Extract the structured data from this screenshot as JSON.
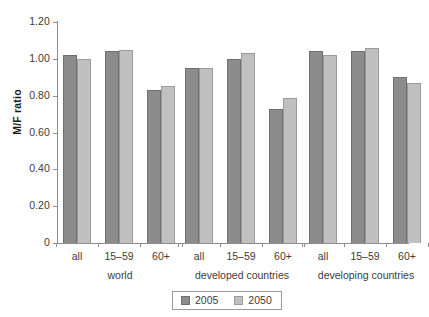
{
  "chart_data": {
    "type": "bar",
    "title": "",
    "xlabel": "",
    "ylabel": "M/F ratio",
    "ylim": [
      0,
      1.2
    ],
    "grid": false,
    "legend_position": "bottom-center",
    "y_ticks": [
      "0",
      "0.20",
      "0.40",
      "0.60",
      "0.80",
      "1.00",
      "1.20"
    ],
    "y_tick_values": [
      0,
      0.2,
      0.4,
      0.6,
      0.8,
      1.0,
      1.2
    ],
    "groups": [
      {
        "name": "world",
        "categories": [
          "all",
          "15–59",
          "60+"
        ],
        "values_2005": [
          1.02,
          1.04,
          0.83
        ],
        "values_2050": [
          1.0,
          1.05,
          0.85
        ]
      },
      {
        "name": "developed countries",
        "categories": [
          "all",
          "15–59",
          "60+"
        ],
        "values_2005": [
          0.95,
          1.0,
          0.73
        ],
        "values_2050": [
          0.95,
          1.03,
          0.79
        ]
      },
      {
        "name": "developing countries",
        "categories": [
          "all",
          "15–59",
          "60+"
        ],
        "values_2005": [
          1.04,
          1.04,
          0.9
        ],
        "values_2050": [
          1.02,
          1.06,
          0.87
        ]
      }
    ],
    "series": [
      {
        "name": "2005",
        "color": "#8c8c8c",
        "values": [
          1.02,
          1.04,
          0.83,
          0.95,
          1.0,
          0.73,
          1.04,
          1.04,
          0.9
        ]
      },
      {
        "name": "2050",
        "color": "#c0c0c0",
        "values": [
          1.0,
          1.05,
          0.85,
          0.95,
          1.03,
          0.79,
          1.02,
          1.06,
          0.87
        ]
      }
    ],
    "categories": [
      "all",
      "15–59",
      "60+",
      "all",
      "15–59",
      "60+",
      "all",
      "15–59",
      "60+"
    ]
  },
  "legend": {
    "entries": [
      {
        "label": "2005",
        "color": "#8c8c8c"
      },
      {
        "label": "2050",
        "color": "#c0c0c0"
      }
    ]
  },
  "corner": {
    "mark": ""
  }
}
